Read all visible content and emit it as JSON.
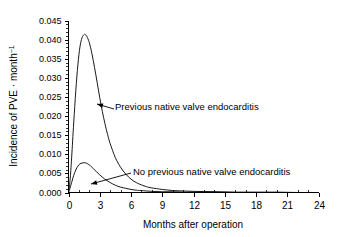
{
  "chart_data": {
    "type": "line",
    "title": "",
    "xlabel": "Months after operation",
    "ylabel": "Incidence of PVE · month",
    "ylabel_exponent": "−1",
    "xlim": [
      0,
      24
    ],
    "ylim": [
      0.0,
      0.045
    ],
    "grid": false,
    "legend": "none (inline annotations with leader arrows)",
    "x_ticks": [
      "0",
      "3",
      "6",
      "9",
      "12",
      "15",
      "18",
      "21",
      "24"
    ],
    "x_tick_values": [
      0,
      3,
      6,
      9,
      12,
      15,
      18,
      21,
      24
    ],
    "x_minor_tick_interval": 1,
    "y_ticks": [
      "0.000",
      "0.005",
      "0.010",
      "0.015",
      "0.020",
      "0.025",
      "0.030",
      "0.035",
      "0.040",
      "0.045"
    ],
    "y_tick_values": [
      0.0,
      0.005,
      0.01,
      0.015,
      0.02,
      0.025,
      0.03,
      0.035,
      0.04,
      0.045
    ],
    "y_minor_tick_interval": 0.001,
    "line_color": "#000000",
    "background_color": "#ffffff",
    "series": [
      {
        "name": "Previous native valve endocarditis",
        "peak_x": 1.6,
        "peak_y": 0.0413,
        "x": [
          0,
          0.15,
          0.3,
          0.5,
          0.7,
          0.9,
          1.1,
          1.3,
          1.5,
          1.6,
          1.75,
          2.0,
          2.25,
          2.5,
          2.75,
          3.0,
          3.25,
          3.5,
          3.75,
          4.0,
          4.5,
          5.0,
          5.5,
          6.0,
          6.5,
          7.0,
          7.5,
          8.0,
          9.0,
          10.0,
          11.0,
          12.0,
          14.0,
          16.0,
          18.0,
          20.0,
          22.0,
          24.0
        ],
        "y": [
          0.0,
          0.0032,
          0.0091,
          0.0182,
          0.0266,
          0.0334,
          0.0381,
          0.0405,
          0.0413,
          0.0413,
          0.0409,
          0.0392,
          0.0363,
          0.0327,
          0.0288,
          0.0248,
          0.0212,
          0.018,
          0.0152,
          0.0128,
          0.0091,
          0.0066,
          0.0048,
          0.0035,
          0.0026,
          0.002,
          0.0015,
          0.0012,
          0.0008,
          0.0005,
          0.0004,
          0.0003,
          0.0002,
          0.0001,
          0.0001,
          0.0001,
          0.0,
          0.0
        ]
      },
      {
        "name": "No previous native valve endocarditis",
        "peak_x": 1.5,
        "peak_y": 0.0078,
        "x": [
          0,
          0.15,
          0.3,
          0.5,
          0.7,
          0.9,
          1.1,
          1.3,
          1.5,
          1.7,
          1.9,
          2.1,
          2.4,
          2.7,
          3.0,
          3.3,
          3.6,
          4.0,
          4.5,
          5.0,
          5.5,
          6.0,
          6.5,
          7.0,
          8.0,
          9.0,
          10.0,
          11.0,
          12.0,
          14.0,
          16.0,
          18.0,
          20.0,
          22.0,
          24.0
        ],
        "y": [
          0.0,
          0.0012,
          0.0026,
          0.0045,
          0.0059,
          0.0069,
          0.0075,
          0.0077,
          0.0078,
          0.0077,
          0.0074,
          0.007,
          0.0062,
          0.0054,
          0.0046,
          0.0039,
          0.0033,
          0.0026,
          0.0019,
          0.0014,
          0.0011,
          0.0008,
          0.0006,
          0.0005,
          0.0003,
          0.0002,
          0.0002,
          0.0001,
          0.0001,
          0.0001,
          0.0,
          0.0,
          0.0,
          0.0,
          0.0
        ]
      }
    ],
    "annotations": [
      {
        "text": "Previous native valve endocarditis",
        "text_x": 115,
        "text_y": 107,
        "arrow_from_x": 114,
        "arrow_from_y": 109,
        "arrow_to_x": 97,
        "arrow_to_y": 104
      },
      {
        "text": "No previous native valve endocarditis",
        "text_x": 133,
        "text_y": 172,
        "arrow_from_x": 131,
        "arrow_from_y": 173,
        "arrow_to_x": 91,
        "arrow_to_y": 184
      }
    ]
  }
}
